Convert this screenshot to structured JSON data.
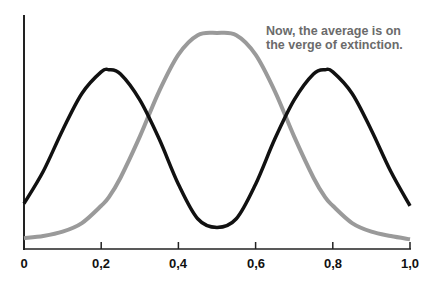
{
  "chart_data": {
    "type": "line",
    "title": "",
    "xlabel": "",
    "ylabel": "",
    "xlim": [
      0,
      1.0
    ],
    "x_ticks": [
      "0",
      "0,2",
      "0,4",
      "0,6",
      "0,8",
      "1,0"
    ],
    "grid": false,
    "legend": null,
    "annotation": {
      "line1": "Now, the average is on",
      "line2": "the verge of extinction."
    },
    "x": [
      0,
      0.05,
      0.1,
      0.15,
      0.2,
      0.22,
      0.25,
      0.3,
      0.35,
      0.4,
      0.45,
      0.5,
      0.55,
      0.6,
      0.65,
      0.7,
      0.75,
      0.78,
      0.8,
      0.85,
      0.9,
      0.95,
      1.0
    ],
    "series": [
      {
        "name": "bimodal (black)",
        "color": "#111111",
        "values": [
          0.21,
          0.36,
          0.55,
          0.72,
          0.82,
          0.83,
          0.81,
          0.69,
          0.51,
          0.3,
          0.14,
          0.1,
          0.14,
          0.3,
          0.51,
          0.69,
          0.81,
          0.83,
          0.82,
          0.72,
          0.55,
          0.36,
          0.2
        ]
      },
      {
        "name": "unimodal (gray)",
        "color": "#9a9a9a",
        "values": [
          0.05,
          0.06,
          0.08,
          0.12,
          0.2,
          0.24,
          0.33,
          0.52,
          0.73,
          0.9,
          0.99,
          1.0,
          0.99,
          0.9,
          0.73,
          0.52,
          0.33,
          0.24,
          0.2,
          0.12,
          0.08,
          0.06,
          0.045
        ]
      }
    ]
  },
  "labels": {
    "x0": "0",
    "x1": "0,2",
    "x2": "0,4",
    "x3": "0,6",
    "x4": "0,8",
    "x5": "1,0",
    "annot1": "Now, the average is on",
    "annot2": "the verge of extinction."
  }
}
